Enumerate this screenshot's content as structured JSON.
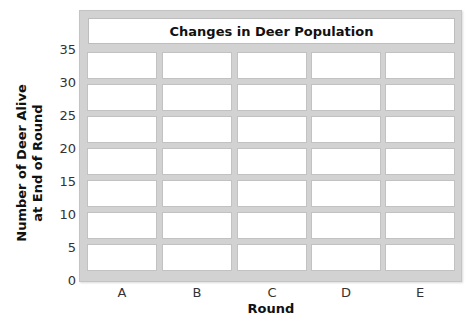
{
  "chart_data": {
    "type": "bar",
    "title": "Changes in Deer Population",
    "xlabel": "Round",
    "ylabel": "Number of Deer Alive at End of Round",
    "ylabel_lines": [
      "Number of Deer Alive",
      "at End of Round"
    ],
    "categories": [
      "A",
      "B",
      "C",
      "D",
      "E"
    ],
    "values": [
      null,
      null,
      null,
      null,
      null
    ],
    "yticks": [
      "35",
      "30",
      "25",
      "20",
      "15",
      "10",
      "5",
      "0"
    ],
    "ylim": [
      0,
      35
    ],
    "grid": true,
    "note": "Blank grid/table to be filled in; no data plotted"
  },
  "colors": {
    "grid": "#d2d2d2",
    "cell": "#ffffff",
    "text": "#222222"
  }
}
